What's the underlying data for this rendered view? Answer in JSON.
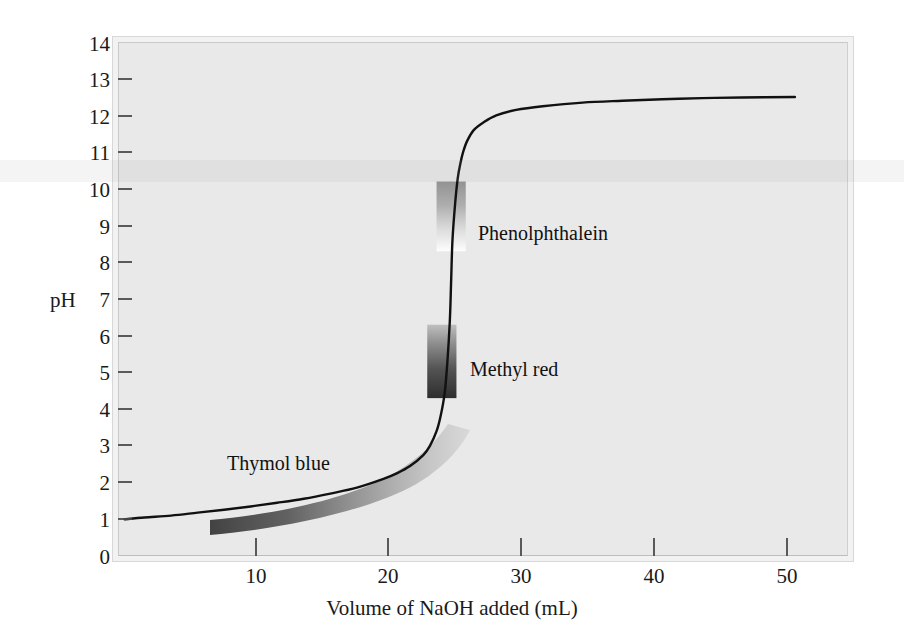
{
  "chart_data": {
    "type": "line",
    "title": "",
    "xlabel": "Volume of NaOH added (mL)",
    "ylabel": "pH",
    "xlim": [
      0,
      55
    ],
    "ylim": [
      0,
      14
    ],
    "grid": false,
    "legend": "none",
    "xticks": [
      10,
      20,
      30,
      40,
      50
    ],
    "xtick_labels": [
      "10",
      "20",
      "30",
      "40",
      "50"
    ],
    "yticks": [
      0,
      1,
      2,
      3,
      4,
      5,
      6,
      7,
      8,
      9,
      10,
      11,
      12,
      13,
      14
    ],
    "ytick_labels": [
      "0",
      "1",
      "2",
      "3",
      "4",
      "5",
      "6",
      "7",
      "8",
      "9",
      "10",
      "11",
      "12",
      "13",
      "14"
    ],
    "series": [
      {
        "name": "Titration curve",
        "color": "#111111",
        "x": [
          0.5,
          2,
          4,
          6,
          8,
          10,
          12,
          14,
          16,
          18,
          20,
          21,
          22,
          23,
          23.5,
          24,
          24.3,
          24.6,
          24.8,
          25,
          25.1,
          25.2,
          25.4,
          25.6,
          25.8,
          26,
          26.3,
          26.8,
          27.5,
          28.5,
          30,
          32,
          35,
          38,
          41,
          44,
          47,
          51
        ],
        "y": [
          1.0,
          1.05,
          1.1,
          1.18,
          1.26,
          1.35,
          1.45,
          1.56,
          1.7,
          1.86,
          2.1,
          2.25,
          2.45,
          2.75,
          3.0,
          3.4,
          3.8,
          4.4,
          5.2,
          6.4,
          7.5,
          8.6,
          9.6,
          10.3,
          10.7,
          11.0,
          11.3,
          11.6,
          11.8,
          12.0,
          12.15,
          12.25,
          12.35,
          12.4,
          12.44,
          12.47,
          12.49,
          12.5
        ]
      }
    ],
    "annotations": [
      {
        "name": "Phenolphthalein",
        "label": "Phenolphthalein",
        "x_range": [
          24.0,
          26.2
        ],
        "ph_range": [
          8.3,
          10.2
        ],
        "gradient": "dark-top-to-white-bottom"
      },
      {
        "name": "Methyl red",
        "label": "Methyl red",
        "x_range": [
          23.3,
          25.5
        ],
        "ph_range": [
          4.3,
          6.3
        ],
        "gradient": "light-top-to-dark-bottom"
      },
      {
        "name": "Thymol blue",
        "label": "Thymol blue",
        "x_range": [
          5.0,
          24.5
        ],
        "ph_range": [
          1.2,
          2.8
        ],
        "gradient": "dark-left-to-light-right",
        "shape": "curved-ribbon-following-curve"
      }
    ]
  },
  "axes": {
    "y_title": "pH",
    "x_title": "Volume of NaOH added (mL)"
  },
  "labels": {
    "phenolphthalein": "Phenolphthalein",
    "methyl_red": "Methyl red",
    "thymol_blue": "Thymol blue"
  },
  "colors": {
    "page_background": "#ffffff",
    "plot_background": "#e9e9e9",
    "frame_outer": "#f2f2f2",
    "frame_border": "#c9c9c9",
    "curve": "#111111",
    "text": "#1a1a1a",
    "band_dark": "#3a3a3a",
    "band_mid": "#8a8a8a",
    "band_light": "#d5d5d5"
  }
}
